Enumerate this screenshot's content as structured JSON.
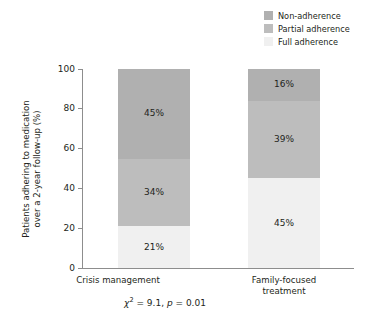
{
  "legend": {
    "position": "top-right",
    "items": [
      {
        "label": "Non-adherence",
        "color": "#b0b0b0",
        "key": "non_adherence"
      },
      {
        "label": "Partial adherence",
        "color": "#bdbdbd",
        "key": "partial_adherence"
      },
      {
        "label": "Full adherence",
        "color": "#f0f0f0",
        "key": "full_adherence"
      }
    ]
  },
  "axes": {
    "ylabel_line1": "Patients adhering to medication",
    "ylabel_line2": "over a 2-year follow-up (%)",
    "yticks": [
      "0",
      "20",
      "40",
      "60",
      "80",
      "100"
    ],
    "xlabel": ""
  },
  "categories": [
    {
      "line1": "Crisis management",
      "line2": ""
    },
    {
      "line1": "Family-focused",
      "line2": "treatment"
    }
  ],
  "bars": [
    {
      "category": "Crisis management",
      "segments": [
        {
          "key": "non_adherence",
          "value": 45,
          "label": "45%",
          "color": "#b0b0b0"
        },
        {
          "key": "partial_adherence",
          "value": 34,
          "label": "34%",
          "color": "#bdbdbd"
        },
        {
          "key": "full_adherence",
          "value": 21,
          "label": "21%",
          "color": "#f0f0f0"
        }
      ]
    },
    {
      "category": "Family-focused treatment",
      "segments": [
        {
          "key": "non_adherence",
          "value": 16,
          "label": "16%",
          "color": "#b0b0b0"
        },
        {
          "key": "partial_adherence",
          "value": 39,
          "label": "39%",
          "color": "#bdbdbd"
        },
        {
          "key": "full_adherence",
          "value": 45,
          "label": "45%",
          "color": "#f0f0f0"
        }
      ]
    }
  ],
  "footnote": {
    "chi_symbol": "χ",
    "chi_exponent": "2",
    "chi_text": " = 9.1, ",
    "p_symbol": "p",
    "p_text": " = 0.01"
  },
  "chart_data": {
    "type": "bar",
    "subtype": "stacked-100",
    "title": "",
    "xlabel": "",
    "ylabel": "Patients adhering to medication over a 2-year follow-up (%)",
    "ylim": [
      0,
      100
    ],
    "yticks": [
      0,
      20,
      40,
      60,
      80,
      100
    ],
    "grid": false,
    "legend_position": "top-right",
    "categories": [
      "Crisis management",
      "Family-focused treatment"
    ],
    "series": [
      {
        "name": "Full adherence",
        "values": [
          21,
          45
        ],
        "color": "#f0f0f0",
        "stack_order": 1
      },
      {
        "name": "Partial adherence",
        "values": [
          34,
          39
        ],
        "color": "#bdbdbd",
        "stack_order": 2
      },
      {
        "name": "Non-adherence",
        "values": [
          45,
          16
        ],
        "color": "#b0b0b0",
        "stack_order": 3
      }
    ],
    "data_labels": [
      {
        "category": "Crisis management",
        "series": "Non-adherence",
        "text": "45%"
      },
      {
        "category": "Crisis management",
        "series": "Partial adherence",
        "text": "34%"
      },
      {
        "category": "Crisis management",
        "series": "Full adherence",
        "text": "21%"
      },
      {
        "category": "Family-focused treatment",
        "series": "Non-adherence",
        "text": "16%"
      },
      {
        "category": "Family-focused treatment",
        "series": "Partial adherence",
        "text": "39%"
      },
      {
        "category": "Family-focused treatment",
        "series": "Full adherence",
        "text": "45%"
      }
    ],
    "annotations": [
      "χ² = 9.1, p = 0.01"
    ]
  }
}
